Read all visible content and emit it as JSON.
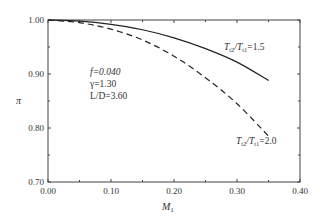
{
  "chart_data": {
    "type": "line",
    "title": "",
    "xlabel": "M1",
    "ylabel": "π",
    "xlim": [
      0.0,
      0.4
    ],
    "ylim": [
      0.7,
      1.0
    ],
    "xticks": [
      "0.00",
      "0.10",
      "0.20",
      "0.30",
      "0.40"
    ],
    "yticks": [
      "0.70",
      "0.80",
      "0.90",
      "1.00"
    ],
    "grid": false,
    "series": [
      {
        "name": "Tt2/Tt1=1.5",
        "style": "solid",
        "x": [
          0.0,
          0.05,
          0.1,
          0.15,
          0.2,
          0.25,
          0.3,
          0.35
        ],
        "y": [
          1.0,
          0.998,
          0.992,
          0.982,
          0.967,
          0.947,
          0.922,
          0.888
        ]
      },
      {
        "name": "Tt2/Tt1=2.0",
        "style": "dashed",
        "x": [
          0.0,
          0.05,
          0.1,
          0.15,
          0.2,
          0.25,
          0.3,
          0.35
        ],
        "y": [
          1.0,
          0.995,
          0.983,
          0.963,
          0.933,
          0.893,
          0.845,
          0.785
        ]
      }
    ],
    "annotations": [
      "f=0.040",
      "γ=1.30",
      "L/D=3.60",
      "Tt2/Tt1=1.5",
      "Tt2/Tt1=2.0"
    ]
  },
  "labels": {
    "xlabel_main": "M",
    "xlabel_sub": "1",
    "ylabel": "π",
    "param_f": "f=0.040",
    "param_gamma": "γ=1.30",
    "param_ld": "L/D=3.60",
    "curve1_T": "T",
    "curve1_sub1": "t2",
    "curve1_mid": "/T",
    "curve1_sub2": "t1",
    "curve1_val": "=1.5",
    "curve2_T": "T",
    "curve2_sub1": "t2",
    "curve2_mid": "/T",
    "curve2_sub2": "t1",
    "curve2_val": "=2.0"
  }
}
